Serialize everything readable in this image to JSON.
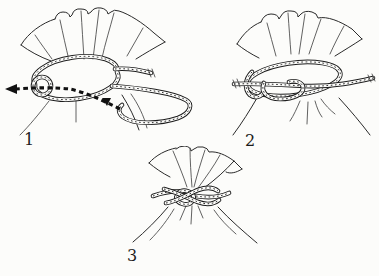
{
  "colors": {
    "ink": "#1c1c1c",
    "paper": "#fcfcfa"
  },
  "steps": [
    {
      "label": "1"
    },
    {
      "label": "2"
    },
    {
      "label": "3"
    }
  ]
}
